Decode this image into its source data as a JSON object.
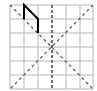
{
  "diagram": {
    "grid": {
      "cols": 6,
      "rows": 6,
      "x0": 10,
      "y0": 5,
      "cell_w": 13.83,
      "cell_h": 14,
      "line_color": "#b5b5b5"
    },
    "axes": {
      "center_vertical": {
        "x": 52,
        "style": "dashed",
        "color": "#444444"
      },
      "diagonal_main": {
        "from": [
          10,
          5
        ],
        "to": [
          93,
          89
        ],
        "style": "dashed",
        "color": "#555555"
      },
      "diagonal_anti": {
        "from": [
          93,
          5
        ],
        "to": [
          10,
          89
        ],
        "style": "dashed",
        "color": "#555555"
      }
    },
    "shape": {
      "type": "polyline",
      "points": "24,19 24,5 38,19 38,33",
      "color": "#000000"
    }
  }
}
